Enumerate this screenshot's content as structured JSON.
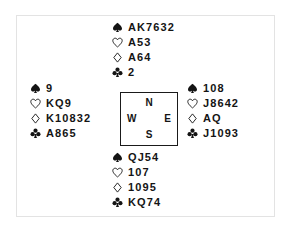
{
  "diagram": {
    "type": "bridge-deal-diagram",
    "suits": [
      {
        "key": "spade",
        "name": "spade-icon",
        "glyph": "♠",
        "fill": "solid",
        "color": "#141414"
      },
      {
        "key": "heart",
        "name": "heart-icon",
        "glyph": "♡",
        "fill": "outline",
        "color": "#141414"
      },
      {
        "key": "diamond",
        "name": "diamond-icon",
        "glyph": "♢",
        "fill": "outline",
        "color": "#141414"
      },
      {
        "key": "club",
        "name": "club-icon",
        "glyph": "♣",
        "fill": "solid",
        "color": "#141414"
      }
    ],
    "hands": {
      "north": {
        "position": "North",
        "spades": "AK7632",
        "hearts": "A53",
        "diamonds": "A64",
        "clubs": "2"
      },
      "west": {
        "position": "West",
        "spades": "9",
        "hearts": "KQ9",
        "diamonds": "K10832",
        "clubs": "A865"
      },
      "east": {
        "position": "East",
        "spades": "108",
        "hearts": "J8642",
        "diamonds": "AQ",
        "clubs": "J1093"
      },
      "south": {
        "position": "South",
        "spades": "QJ54",
        "hearts": "107",
        "diamonds": "1095",
        "clubs": "KQ74"
      }
    },
    "compass": {
      "north_label": "N",
      "west_label": "W",
      "east_label": "E",
      "south_label": "S"
    },
    "colors": {
      "ink": "#141414",
      "frame": "#e3e3e3",
      "box_border": "#1a1a1a",
      "background": "#ffffff"
    }
  }
}
